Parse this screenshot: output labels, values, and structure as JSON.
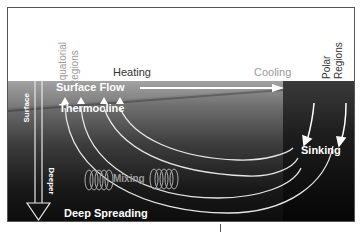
{
  "diagram": {
    "labels": {
      "equatorial_regions": "Equatorial Regions",
      "equatorial_line1": "Equatorial",
      "equatorial_line2": "Regions",
      "polar_line1": "Polar",
      "polar_line2": "Regions",
      "heating": "Heating",
      "cooling": "Cooling",
      "surface_flow": "Surface Flow",
      "thermocline": "Thermocline",
      "surface": "Surface",
      "deeper": "Deeper",
      "mixing": "Mixing",
      "sinking": "Sinking",
      "deep_spreading": "Deep Spreading"
    },
    "colors": {
      "frame": "#555555",
      "ocean_top": "#9a9a9a",
      "ocean_bottom": "#0c0c0c",
      "polar_block": "#1c1c1c",
      "label_light": "#ffffff",
      "label_gray": "#9a9a9a",
      "label_dark": "#333333"
    }
  }
}
